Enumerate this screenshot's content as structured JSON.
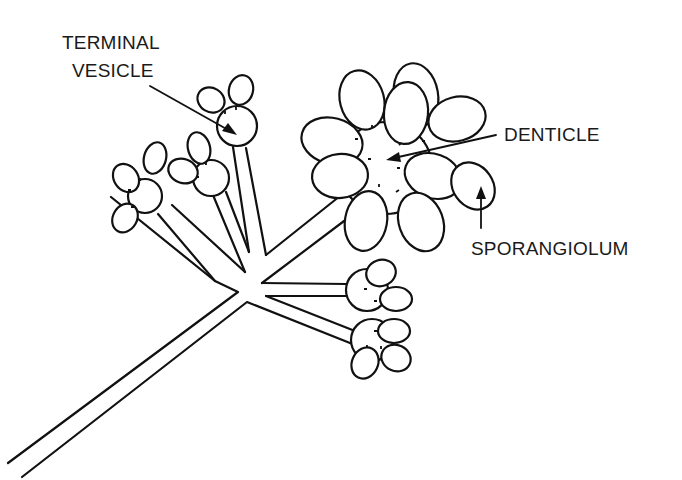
{
  "figure": {
    "labels": {
      "terminal_vesicle_line1": "TERMINAL",
      "terminal_vesicle_line2": "VESICLE",
      "denticle": "DENTICLE",
      "sporangiolum": "SPORANGIOLUM"
    },
    "colors": {
      "stroke": "#111111",
      "background": "#ffffff",
      "text": "#1a1a1a"
    }
  }
}
